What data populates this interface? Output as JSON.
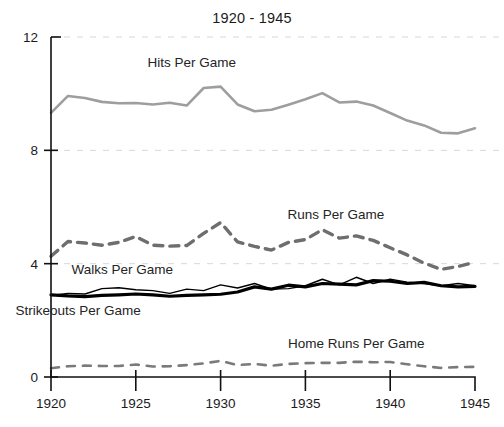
{
  "chart_data": {
    "type": "line",
    "title": "1920 - 1945",
    "xlabel": "",
    "ylabel": "",
    "xlim": [
      1920,
      1945
    ],
    "ylim": [
      0,
      12
    ],
    "yticks": [
      0,
      4,
      8,
      12
    ],
    "xticks": [
      1920,
      1925,
      1930,
      1935,
      1940,
      1945
    ],
    "grid": "faint-horizontal-dashed",
    "legend": "inline-annotations",
    "x": [
      1920,
      1921,
      1922,
      1923,
      1924,
      1925,
      1926,
      1927,
      1928,
      1929,
      1930,
      1931,
      1932,
      1933,
      1934,
      1935,
      1936,
      1937,
      1938,
      1939,
      1940,
      1941,
      1942,
      1943,
      1944,
      1945
    ],
    "series": [
      {
        "name": "Hits Per Game",
        "style": "solid-gray",
        "color": "#9e9e9e",
        "width": 2.6,
        "label_x": 1928.3,
        "label_y": 10.95,
        "values": [
          9.32,
          9.92,
          9.85,
          9.71,
          9.66,
          9.67,
          9.62,
          9.68,
          9.58,
          10.2,
          10.25,
          9.62,
          9.38,
          9.43,
          9.61,
          9.8,
          10.02,
          9.69,
          9.72,
          9.58,
          9.32,
          9.05,
          8.88,
          8.62,
          8.6,
          8.78
        ]
      },
      {
        "name": "Runs Per Game",
        "style": "dashed-gray",
        "color": "#6e6e6e",
        "width": 3.4,
        "dash": "9 7",
        "label_x": 1936.8,
        "label_y": 5.58,
        "values": [
          4.26,
          4.78,
          4.73,
          4.65,
          4.75,
          4.96,
          4.65,
          4.62,
          4.64,
          5.07,
          5.45,
          4.77,
          4.61,
          4.48,
          4.75,
          4.85,
          5.2,
          4.9,
          4.98,
          4.82,
          4.56,
          4.31,
          4.02,
          3.8,
          3.9,
          4.05
        ]
      },
      {
        "name": "Walks Per Game",
        "style": "solid-black-thin",
        "color": "#000000",
        "width": 1.4,
        "label_x": 1924.2,
        "label_y": 3.62,
        "values": [
          2.88,
          2.95,
          2.93,
          3.12,
          3.15,
          3.08,
          3.05,
          2.95,
          3.1,
          3.05,
          3.25,
          3.14,
          3.3,
          3.1,
          3.12,
          3.22,
          3.45,
          3.25,
          3.52,
          3.3,
          3.45,
          3.35,
          3.3,
          3.22,
          3.3,
          3.22
        ]
      },
      {
        "name": "Strikeouts Per Game",
        "style": "solid-black-thick",
        "color": "#000000",
        "width": 3.2,
        "label_x": 1921.6,
        "label_y": 2.2,
        "values": [
          2.9,
          2.86,
          2.84,
          2.88,
          2.9,
          2.93,
          2.9,
          2.85,
          2.88,
          2.9,
          2.92,
          3.0,
          3.18,
          3.1,
          3.24,
          3.18,
          3.3,
          3.28,
          3.25,
          3.4,
          3.38,
          3.3,
          3.34,
          3.22,
          3.18,
          3.2
        ]
      },
      {
        "name": "Home Runs Per Game",
        "style": "dashed-gray-thin",
        "color": "#7a7a7a",
        "width": 2.6,
        "dash": "8 8",
        "label_x": 1938.0,
        "label_y": 1.02,
        "values": [
          0.31,
          0.38,
          0.4,
          0.39,
          0.39,
          0.44,
          0.37,
          0.38,
          0.42,
          0.48,
          0.57,
          0.42,
          0.46,
          0.4,
          0.46,
          0.49,
          0.5,
          0.5,
          0.54,
          0.52,
          0.53,
          0.45,
          0.38,
          0.32,
          0.35,
          0.36
        ]
      }
    ]
  }
}
